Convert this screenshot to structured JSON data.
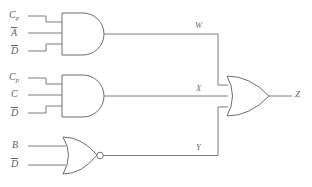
{
  "diagram": {
    "type": "logic-circuit",
    "background_color": "#ffffff",
    "line_color": "#7d7d7d",
    "text_color": "#5f5f5f"
  },
  "gates": [
    {
      "id": "and-1",
      "type": "AND",
      "output_label": "W",
      "inputs": [
        {
          "base": "C",
          "subscript": "p",
          "overbar": false
        },
        {
          "base": "A",
          "subscript": "",
          "overbar": true
        },
        {
          "base": "D",
          "subscript": "",
          "overbar": true
        }
      ]
    },
    {
      "id": "and-2",
      "type": "AND",
      "output_label": "X",
      "inputs": [
        {
          "base": "C",
          "subscript": "p",
          "overbar": false
        },
        {
          "base": "C",
          "subscript": "",
          "overbar": false
        },
        {
          "base": "D",
          "subscript": "",
          "overbar": true
        }
      ]
    },
    {
      "id": "nor-1",
      "type": "NOR",
      "output_label": "Y",
      "inputs": [
        {
          "base": "B",
          "subscript": "",
          "overbar": false
        },
        {
          "base": "D",
          "subscript": "",
          "overbar": true
        }
      ]
    },
    {
      "id": "or-1",
      "type": "OR",
      "output_label": "Z",
      "inputs": [
        {
          "base": "W",
          "subscript": "",
          "overbar": false
        },
        {
          "base": "X",
          "subscript": "",
          "overbar": false
        },
        {
          "base": "Y",
          "subscript": "",
          "overbar": false
        }
      ]
    }
  ],
  "input_labels": {
    "g1_in1_base": "C",
    "g1_in1_sub": "p",
    "g1_in2_base": "A",
    "g1_in3_base": "D",
    "g2_in1_base": "C",
    "g2_in1_sub": "p",
    "g2_in2_base": "C",
    "g2_in3_base": "D",
    "g3_in1_base": "B",
    "g3_in2_base": "D"
  },
  "wire_labels": {
    "w": "W",
    "x": "X",
    "y": "Y",
    "z": "Z"
  }
}
